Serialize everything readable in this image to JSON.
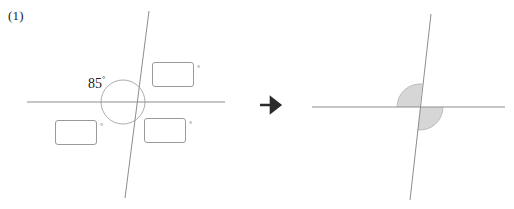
{
  "problem": {
    "number_label": "(1)",
    "type": "angle-relationships-worksheet"
  },
  "colors": {
    "line": "#8d8d8d",
    "circle": "#9a9a9a",
    "box_border": "#9a9a9a",
    "shade_fill": "#d6d6d6",
    "text": "#1a1a1a",
    "degree_mark": "#6e6e6e",
    "arrow": "#2b2b2b",
    "background": "#ffffff"
  },
  "left_figure": {
    "name": "two-intersecting-lines-with-85-degree-angle",
    "given_angle": {
      "value": "85",
      "degree_symbol": "°",
      "full": "85°"
    },
    "circle": {
      "cx": 123,
      "cy": 102,
      "r": 22
    },
    "horizontal_line": {
      "x1": 27,
      "y1": 102,
      "x2": 225,
      "y2": 102
    },
    "slanted_line": {
      "x1": 149,
      "y1": 11,
      "x2": 125,
      "y2": 198
    },
    "answer_boxes": [
      {
        "id": "answer-box-upper-right",
        "left": 152,
        "top": 62,
        "width": 42,
        "height": 25,
        "value": "",
        "degree_symbol": "°"
      },
      {
        "id": "answer-box-lower-left",
        "left": 55,
        "top": 120,
        "width": 42,
        "height": 25,
        "value": "",
        "degree_symbol": "°"
      },
      {
        "id": "answer-box-lower-right",
        "left": 144,
        "top": 118,
        "width": 42,
        "height": 25,
        "value": "",
        "degree_symbol": "°"
      }
    ]
  },
  "transition": {
    "icon": "right-arrow-icon",
    "glyph": "→"
  },
  "right_figure": {
    "name": "two-intersecting-lines-with-shaded-vertical-angles",
    "circle_guide": {
      "cx": 420,
      "cy": 107,
      "r": 23
    },
    "horizontal_line": {
      "x1": 312,
      "y1": 107,
      "x2": 505,
      "y2": 107
    },
    "slanted_line": {
      "x1": 431,
      "y1": 14,
      "x2": 410,
      "y2": 200
    },
    "shaded_sectors": [
      {
        "id": "shaded-sector-upper-left",
        "description": "sector between leftward ray and upward slanted ray"
      },
      {
        "id": "shaded-sector-lower-right",
        "description": "sector between rightward ray and downward slanted ray"
      }
    ]
  }
}
